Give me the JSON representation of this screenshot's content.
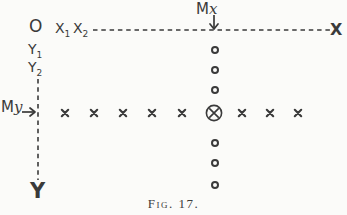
{
  "figure": {
    "caption": "Fig. 17.",
    "ink_color": "#3a3a3a",
    "paper_color": "#fbfbf9"
  },
  "labels": {
    "origin": "O",
    "x1": {
      "base": "X",
      "sub": "1"
    },
    "x2": {
      "base": "X",
      "sub": "2"
    },
    "y1": {
      "base": "Y",
      "sub": "1"
    },
    "y2": {
      "base": "Y",
      "sub": "2"
    },
    "mx": {
      "base": "M",
      "var": "x"
    },
    "my": {
      "base": "M",
      "var": "y"
    },
    "x_axis_end": "X",
    "y_axis_end": "Y"
  },
  "diagram": {
    "x_axis": {
      "y": 30,
      "x_start": 93,
      "x_end": 330,
      "style": "dashed"
    },
    "y_axis": {
      "x": 38,
      "y_start": 79,
      "y_end": 180,
      "style": "dashed"
    },
    "mx_arrow": {
      "x": 214,
      "y_from": 15,
      "y_to": 29,
      "direction": "down"
    },
    "my_arrow": {
      "y": 112,
      "x_from": 22,
      "x_to": 35,
      "direction": "right"
    },
    "load_row": {
      "y": 113,
      "marker": "x",
      "x_positions": [
        65,
        94,
        123,
        152,
        182,
        242,
        270,
        298
      ]
    },
    "load_column": {
      "x": 215,
      "marker": "o",
      "y_positions": [
        50,
        70,
        90,
        143,
        163,
        185
      ]
    },
    "center_marker": {
      "x": 214,
      "y": 113,
      "symbol": "circled-x"
    }
  }
}
